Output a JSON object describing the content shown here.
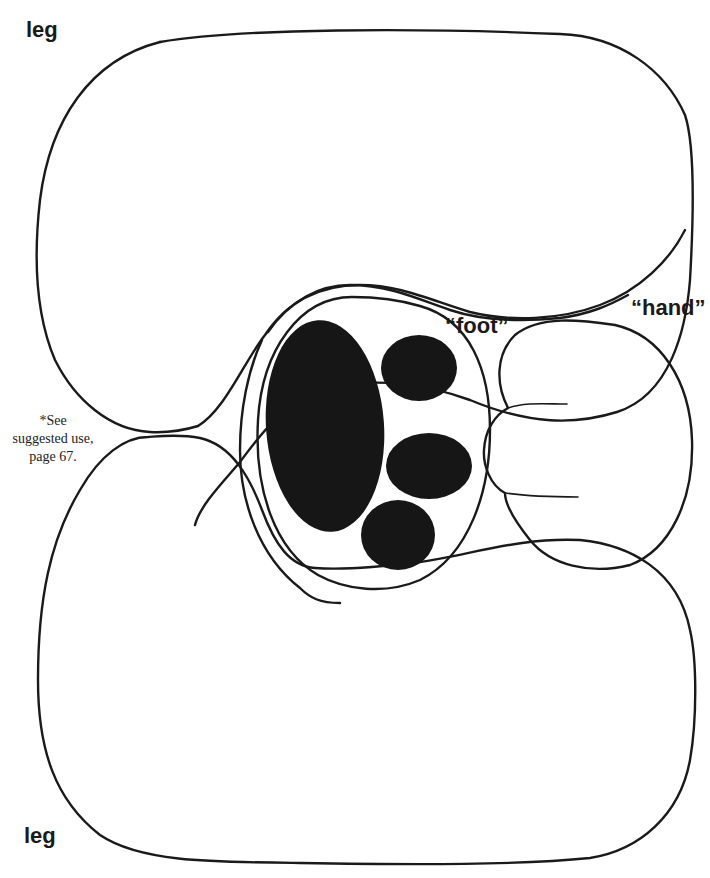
{
  "labels": {
    "leg_top": "leg",
    "leg_bottom": "leg",
    "foot": "“foot”",
    "hand": "“hand”"
  },
  "note": {
    "line1": "*See",
    "line2": "suggested use,",
    "line3": "page 67."
  },
  "pieces": [
    {
      "name": "leg-top",
      "type": "outline"
    },
    {
      "name": "leg-bottom",
      "type": "outline"
    },
    {
      "name": "foot-outer",
      "type": "outline"
    },
    {
      "name": "foot-inner",
      "type": "outline"
    },
    {
      "name": "hand",
      "type": "outline"
    },
    {
      "name": "paw-pads",
      "count": 4,
      "fill": "#161616"
    }
  ],
  "colors": {
    "background": "#ffffff",
    "line": "#1a1a1a",
    "pad_fill": "#161616"
  }
}
